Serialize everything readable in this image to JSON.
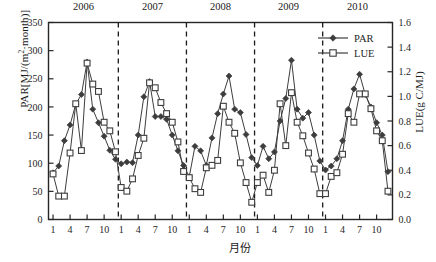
{
  "chart_data": {
    "type": "line",
    "title": "",
    "xlabel": "月份",
    "ylabel": "PAR[MJ/(m²·month)]",
    "y2label": "LUE(g C/MJ)",
    "ylim": [
      0,
      350
    ],
    "y2lim": [
      0.0,
      1.6
    ],
    "yticks": [
      "0",
      "50",
      "100",
      "150",
      "200",
      "250",
      "300",
      "350"
    ],
    "ytick_values": [
      0,
      50,
      100,
      150,
      200,
      250,
      300,
      350
    ],
    "y2ticks": [
      "0.0",
      "0.2",
      "0.4",
      "0.6",
      "0.8",
      "1.0",
      "1.2",
      "1.4",
      "1.6"
    ],
    "y2tick_values": [
      0.0,
      0.2,
      0.4,
      0.6,
      0.8,
      1.0,
      1.2,
      1.4,
      1.6
    ],
    "xticks": [
      "1",
      "4",
      "7",
      "10",
      "1",
      "4",
      "7",
      "10",
      "1",
      "4",
      "7",
      "10",
      "1",
      "4",
      "7",
      "10",
      "1",
      "4",
      "7",
      "10"
    ],
    "xtick_months": [
      1,
      4,
      7,
      10,
      13,
      16,
      19,
      22,
      25,
      28,
      31,
      34,
      37,
      40,
      43,
      46,
      49,
      52,
      55,
      58
    ],
    "years": [
      "2006",
      "2007",
      "2008",
      "2009",
      "2010"
    ],
    "year_dividers": [
      12.5,
      24.5,
      36.5,
      48.5
    ],
    "grid": false,
    "legend_position": "top-right",
    "legend": [
      "PAR",
      "LUE"
    ],
    "series": [
      {
        "name": "PAR",
        "axis": "left",
        "marker": "filled-diamond",
        "color": "#3d3d3d",
        "x": [
          1,
          2,
          3,
          4,
          5,
          6,
          7,
          8,
          9,
          10,
          11,
          12,
          13,
          14,
          15,
          16,
          17,
          18,
          19,
          20,
          21,
          22,
          23,
          24,
          25,
          26,
          27,
          28,
          29,
          30,
          31,
          32,
          33,
          34,
          35,
          36,
          37,
          38,
          39,
          40,
          41,
          42,
          43,
          44,
          45,
          46,
          47,
          48,
          49,
          50,
          51,
          52,
          53,
          54,
          55,
          56,
          57,
          58,
          59,
          60
        ],
        "values": [
          83,
          95,
          140,
          168,
          205,
          222,
          280,
          196,
          172,
          148,
          123,
          107,
          99,
          102,
          101,
          150,
          218,
          245,
          183,
          183,
          178,
          150,
          122,
          96,
          76,
          130,
          122,
          96,
          145,
          188,
          223,
          255,
          196,
          190,
          151,
          110,
          96,
          130,
          108,
          120,
          175,
          215,
          283,
          196,
          180,
          190,
          150,
          104,
          88,
          95,
          108,
          140,
          196,
          232,
          258,
          222,
          200,
          172,
          150,
          85
        ]
      },
      {
        "name": "LUE",
        "axis": "right",
        "marker": "open-square",
        "color": "#3d3d3d",
        "x": [
          1,
          2,
          3,
          4,
          5,
          6,
          7,
          8,
          9,
          10,
          11,
          12,
          13,
          14,
          15,
          16,
          17,
          18,
          19,
          20,
          21,
          22,
          23,
          24,
          25,
          26,
          27,
          28,
          29,
          30,
          31,
          32,
          33,
          34,
          35,
          36,
          37,
          38,
          39,
          40,
          41,
          42,
          43,
          44,
          45,
          46,
          47,
          48,
          49,
          50,
          51,
          52,
          53,
          54,
          55,
          56,
          57,
          58,
          59,
          60
        ],
        "values": [
          0.37,
          0.19,
          0.19,
          0.54,
          0.94,
          0.56,
          1.27,
          1.1,
          1.04,
          0.79,
          0.72,
          0.55,
          0.26,
          0.23,
          0.33,
          0.52,
          0.66,
          1.11,
          1.07,
          0.95,
          0.86,
          0.79,
          0.63,
          0.39,
          0.34,
          0.25,
          0.22,
          0.42,
          0.44,
          0.48,
          0.92,
          0.79,
          0.7,
          0.46,
          0.3,
          0.14,
          0.3,
          0.36,
          0.22,
          0.4,
          0.94,
          0.6,
          1.03,
          0.79,
          0.68,
          0.54,
          0.41,
          0.21,
          0.21,
          0.35,
          0.38,
          0.53,
          0.86,
          0.79,
          1.02,
          1.02,
          0.9,
          0.72,
          0.64,
          0.23
        ]
      }
    ]
  },
  "axes": {
    "left_title_main": "PAR[MJ/(m",
    "left_title_sup": "2",
    "left_title_tail": "·month)]",
    "right_title": "LUE(g C/MJ)",
    "x_title": "月份"
  }
}
